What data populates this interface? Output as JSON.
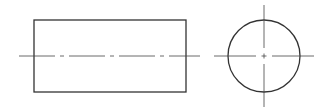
{
  "diagram": {
    "type": "orthographic-projection",
    "colors": {
      "outline": "#333333",
      "centerline": "#444444",
      "background": "#ffffff"
    },
    "front_view": {
      "shape": "rectangle",
      "x": 34,
      "y": 20,
      "width": 152,
      "height": 72,
      "centerline": {
        "x1": 19,
        "y1": 56,
        "x2": 200,
        "y2": 56,
        "pattern": "dash-dot"
      }
    },
    "side_view": {
      "shape": "circle",
      "cx": 264,
      "cy": 56,
      "r": 36,
      "h_centerline": {
        "x1": 214,
        "y1": 56,
        "x2": 314,
        "y2": 56,
        "pattern": "dash-dot"
      },
      "v_centerline": {
        "x1": 264,
        "y1": 5,
        "x2": 264,
        "y2": 107,
        "pattern": "dash-dot"
      }
    }
  }
}
